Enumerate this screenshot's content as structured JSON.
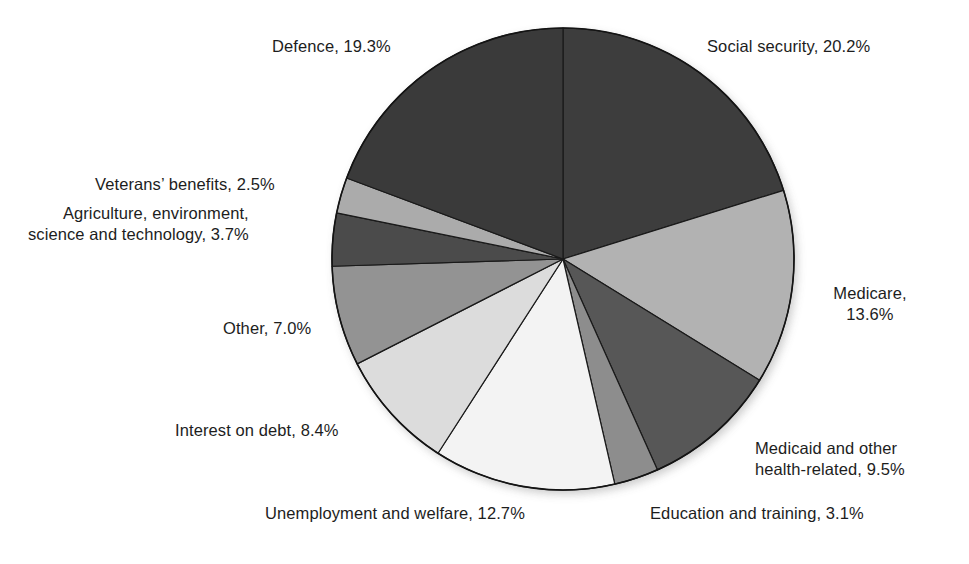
{
  "figure": {
    "background_color": "#ffffff",
    "text_color": "#1d1d1d"
  },
  "chart_data": {
    "type": "pie",
    "title": "",
    "subtitle": "",
    "xlabel": "",
    "ylabel": "",
    "grid": false,
    "legend_position": "none",
    "label_format": "{name}, {value}%",
    "start_angle_deg": 0,
    "direction": "clockwise",
    "units": "percent",
    "total": 100.0,
    "center": {
      "x": 563,
      "y": 259
    },
    "radius": 231,
    "categories": [
      "Social security",
      "Medicare",
      "Medicaid and other health-related",
      "Education and training",
      "Unemployment and welfare",
      "Interest on debt",
      "Other",
      "Agriculture, environment, science and technology",
      "Veterans' benefits",
      "Defence"
    ],
    "values": [
      20.2,
      13.6,
      9.5,
      3.1,
      12.7,
      8.4,
      7.0,
      3.7,
      2.5,
      19.3
    ],
    "colors": [
      "#3d3d3d",
      "#b2b2b2",
      "#575757",
      "#8d8d8d",
      "#f3f3f3",
      "#dcdcdc",
      "#939393",
      "#4b4b4b",
      "#ababab",
      "#3a3a3a"
    ],
    "slice_edge_color": "#1a1a1a",
    "slice_edge_width": 1.2,
    "slices": [
      {
        "name": "Social security",
        "value": 20.2,
        "color": "#3d3d3d"
      },
      {
        "name": "Medicare",
        "value": 13.6,
        "color": "#b2b2b2"
      },
      {
        "name": "Medicaid and other health-related",
        "value": 9.5,
        "color": "#575757"
      },
      {
        "name": "Education and training",
        "value": 3.1,
        "color": "#8d8d8d"
      },
      {
        "name": "Unemployment and welfare",
        "value": 12.7,
        "color": "#f3f3f3"
      },
      {
        "name": "Interest on debt",
        "value": 8.4,
        "color": "#dcdcdc"
      },
      {
        "name": "Other",
        "value": 7.0,
        "color": "#939393"
      },
      {
        "name": "Agriculture, environment, science and technology",
        "value": 3.7,
        "color": "#4b4b4b"
      },
      {
        "name": "Veterans' benefits",
        "value": 2.5,
        "color": "#ababab"
      },
      {
        "name": "Defence",
        "value": 19.3,
        "color": "#3a3a3a"
      }
    ]
  },
  "labels": {
    "social_security": "Social security, 20.2%",
    "medicare": "Medicare,\n13.6%",
    "medicaid": "Medicaid and other\nhealth-related, 9.5%",
    "education": "Education and training, 3.1%",
    "unemployment": "Unemployment and welfare, 12.7%",
    "interest": "Interest on debt, 8.4%",
    "other": "Other, 7.0%",
    "agriculture": "Agriculture, environment,\nscience and technology, 3.7%",
    "veterans": "Veterans’ benefits, 2.5%",
    "defence": "Defence, 19.3%"
  }
}
